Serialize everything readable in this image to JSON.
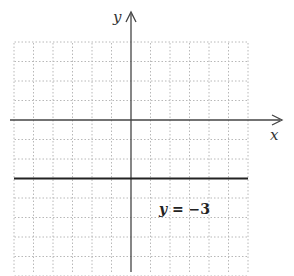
{
  "chart_data": {
    "type": "line",
    "title": "",
    "xlabel": "x",
    "ylabel": "y",
    "xlim": [
      -6,
      6
    ],
    "ylim": [
      -8,
      4
    ],
    "grid": true,
    "grid_style": "dotted",
    "series": [
      {
        "name": "y = -3",
        "x": [
          -6,
          6
        ],
        "y": [
          -3,
          -3
        ]
      }
    ],
    "annotations": [
      {
        "text": "y = −3",
        "x": 2,
        "y": -4.5
      }
    ]
  },
  "labels": {
    "x_axis": "x",
    "y_axis": "y",
    "equation_var": "y",
    "equation_rest": " = −3"
  },
  "colors": {
    "grid": "#b8b8b8",
    "axis": "#444444",
    "line": "#222222"
  }
}
